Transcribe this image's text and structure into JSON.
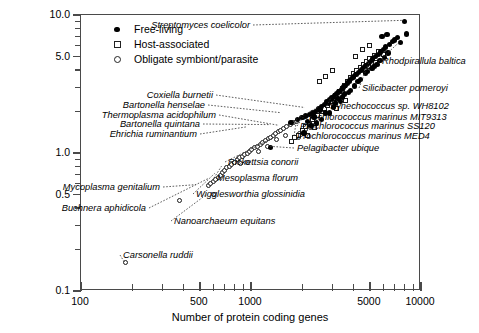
{
  "chart_data": {
    "type": "scatter",
    "title": "",
    "xlabel": "Number of protein coding genes",
    "ylabel": "Genome size (Mb)",
    "xscale": "log",
    "yscale": "log",
    "xlim": [
      100,
      10000
    ],
    "ylim": [
      0.1,
      10.0
    ],
    "grid": false,
    "legend_position": "top-left",
    "xticks": [
      100,
      500,
      1000,
      5000,
      10000
    ],
    "xtick_labels": [
      "100",
      "500",
      "1000",
      "5000",
      "10000"
    ],
    "yticks": [
      0.1,
      0.5,
      1.0,
      5.0,
      10.0
    ],
    "ytick_labels": [
      "0.1",
      "0.5",
      "1.0",
      "5.0",
      "10.0"
    ],
    "legend": [
      {
        "label": "Free-living",
        "marker": "filled-circle"
      },
      {
        "label": "Host-associated",
        "marker": "open-square"
      },
      {
        "label": "Obligate symbiont/parasite",
        "marker": "open-circle"
      }
    ],
    "series": [
      {
        "name": "Obligate symbiont/parasite",
        "marker": "open-circle",
        "points": [
          [
            182,
            0.16
          ],
          [
            380,
            0.45
          ],
          [
            560,
            0.58
          ],
          [
            580,
            0.6
          ],
          [
            600,
            0.62
          ],
          [
            620,
            0.64
          ],
          [
            640,
            0.66
          ],
          [
            660,
            0.69
          ],
          [
            680,
            0.72
          ],
          [
            700,
            0.75
          ],
          [
            720,
            0.78
          ],
          [
            745,
            0.8
          ],
          [
            770,
            0.83
          ],
          [
            800,
            0.86
          ],
          [
            830,
            0.9
          ],
          [
            860,
            0.92
          ],
          [
            890,
            0.95
          ],
          [
            920,
            0.98
          ],
          [
            950,
            1.0
          ],
          [
            980,
            1.03
          ],
          [
            1010,
            1.06
          ],
          [
            1050,
            1.09
          ],
          [
            1090,
            1.12
          ],
          [
            1130,
            1.16
          ],
          [
            1170,
            1.2
          ],
          [
            1210,
            1.24
          ],
          [
            1260,
            1.27
          ],
          [
            1300,
            1.3
          ],
          [
            1350,
            1.34
          ],
          [
            1400,
            1.38
          ],
          [
            1450,
            1.42
          ],
          [
            1500,
            1.46
          ],
          [
            1560,
            1.5
          ],
          [
            1620,
            1.55
          ],
          [
            1700,
            1.6
          ],
          [
            1780,
            1.65
          ],
          [
            1850,
            1.7
          ],
          [
            1930,
            1.38
          ],
          [
            2000,
            1.42
          ],
          [
            2100,
            1.47
          ],
          [
            600,
            0.5
          ],
          [
            960,
            0.86
          ],
          [
            1100,
            1.02
          ],
          [
            1250,
            1.12
          ],
          [
            1420,
            1.25
          ],
          [
            1600,
            1.33
          ],
          [
            2250,
            1.52
          ],
          [
            2400,
            1.6
          ],
          [
            1900,
            1.3
          ],
          [
            870,
            0.84
          ]
        ]
      },
      {
        "name": "Host-associated",
        "marker": "open-square",
        "points": [
          [
            1720,
            1.22
          ],
          [
            1800,
            1.3
          ],
          [
            1900,
            1.35
          ],
          [
            2000,
            1.46
          ],
          [
            2100,
            1.55
          ],
          [
            2200,
            1.62
          ],
          [
            2300,
            1.74
          ],
          [
            2450,
            1.88
          ],
          [
            2600,
            2.0
          ],
          [
            2700,
            2.1
          ],
          [
            2800,
            2.22
          ],
          [
            2950,
            2.35
          ],
          [
            3050,
            2.5
          ],
          [
            3150,
            2.62
          ],
          [
            3300,
            2.78
          ],
          [
            3450,
            2.95
          ],
          [
            3550,
            3.1
          ],
          [
            3700,
            3.3
          ],
          [
            3850,
            3.55
          ],
          [
            4000,
            3.75
          ],
          [
            4200,
            3.95
          ],
          [
            4400,
            4.15
          ],
          [
            4600,
            4.4
          ],
          [
            4800,
            4.6
          ],
          [
            5000,
            4.85
          ],
          [
            5300,
            5.1
          ],
          [
            5600,
            5.4
          ],
          [
            2520,
            3.3
          ],
          [
            2750,
            3.6
          ],
          [
            3000,
            3.95
          ],
          [
            4100,
            5.0
          ],
          [
            4500,
            5.6
          ],
          [
            5000,
            6.0
          ],
          [
            3200,
            2.1
          ],
          [
            3600,
            2.4
          ],
          [
            2350,
            1.52
          ],
          [
            2150,
            1.35
          ],
          [
            4900,
            4.2
          ],
          [
            5400,
            4.55
          ],
          [
            6000,
            5.2
          ]
        ]
      },
      {
        "name": "Free-living",
        "marker": "filled-circle",
        "points": [
          [
            1716,
            1.66
          ],
          [
            1884,
            1.75
          ],
          [
            2000,
            1.8
          ],
          [
            2100,
            1.85
          ],
          [
            2200,
            1.9
          ],
          [
            2300,
            1.95
          ],
          [
            2400,
            2.0
          ],
          [
            2500,
            2.1
          ],
          [
            2600,
            2.18
          ],
          [
            2700,
            2.25
          ],
          [
            2800,
            2.35
          ],
          [
            2900,
            2.42
          ],
          [
            3000,
            2.5
          ],
          [
            3100,
            2.6
          ],
          [
            3200,
            2.7
          ],
          [
            3300,
            2.8
          ],
          [
            3400,
            2.9
          ],
          [
            3500,
            3.0
          ],
          [
            3600,
            3.1
          ],
          [
            3700,
            3.22
          ],
          [
            3800,
            3.32
          ],
          [
            3900,
            3.45
          ],
          [
            4000,
            3.55
          ],
          [
            4150,
            3.7
          ],
          [
            4300,
            3.85
          ],
          [
            4450,
            4.0
          ],
          [
            4600,
            4.15
          ],
          [
            4750,
            4.3
          ],
          [
            4900,
            4.45
          ],
          [
            5050,
            4.6
          ],
          [
            5200,
            4.8
          ],
          [
            5400,
            5.0
          ],
          [
            5600,
            5.2
          ],
          [
            5800,
            5.4
          ],
          [
            6000,
            5.6
          ],
          [
            6200,
            5.85
          ],
          [
            6500,
            6.1
          ],
          [
            6800,
            6.4
          ],
          [
            7000,
            6.6
          ],
          [
            7300,
            6.9
          ],
          [
            5900,
            7.0
          ],
          [
            6300,
            7.2
          ],
          [
            7600,
            6.3
          ],
          [
            8000,
            9.0
          ],
          [
            8200,
            7.3
          ],
          [
            1300,
            1.1
          ],
          [
            2050,
            1.4
          ],
          [
            2250,
            1.58
          ],
          [
            2420,
            1.65
          ],
          [
            2150,
            1.7
          ],
          [
            2600,
            1.75
          ],
          [
            2750,
            1.95
          ],
          [
            3050,
            2.15
          ],
          [
            3350,
            2.35
          ],
          [
            3850,
            2.85
          ],
          [
            4250,
            3.3
          ],
          [
            4700,
            3.8
          ],
          [
            5150,
            4.1
          ],
          [
            5500,
            4.4
          ],
          [
            6100,
            4.9
          ],
          [
            2900,
            1.95
          ],
          [
            3150,
            2.3
          ],
          [
            3450,
            2.55
          ],
          [
            3750,
            2.75
          ],
          [
            4050,
            3.05
          ],
          [
            4400,
            3.4
          ],
          [
            4850,
            3.9
          ],
          [
            5300,
            4.25
          ],
          [
            5750,
            4.7
          ],
          [
            6400,
            5.3
          ],
          [
            2350,
            1.82
          ],
          [
            2550,
            2.05
          ],
          [
            2850,
            2.28
          ],
          [
            3250,
            2.48
          ],
          [
            3550,
            2.68
          ]
        ]
      }
    ],
    "annotations": [
      {
        "text": "Streptomyces coelicolor",
        "x": 8000,
        "y": 9.0
      },
      {
        "text": "Rhodpirallula baltica",
        "x": 7600,
        "y": 6.3
      },
      {
        "text": "Silicibacter pomeroyi",
        "x": 5050,
        "y": 4.6
      },
      {
        "text": "Synechococcus sp. WH8102",
        "x": 3000,
        "y": 2.5
      },
      {
        "text": "Prochlorococcus marinus MIT9313",
        "x": 2500,
        "y": 2.1
      },
      {
        "text": "Prochlorococcus marinus SS120",
        "x": 2100,
        "y": 1.85
      },
      {
        "text": "Prochlorococcus marinus MED4",
        "x": 1884,
        "y": 1.75
      },
      {
        "text": "Pelagibacter ubique",
        "x": 1300,
        "y": 1.1
      },
      {
        "text": "Coxiella burnetii",
        "x": 2100,
        "y": 2.1
      },
      {
        "text": "Bartonella henselae",
        "x": 1500,
        "y": 1.93
      },
      {
        "text": "Thermoplasma acidophilum",
        "x": 1480,
        "y": 1.56
      },
      {
        "text": "Bartonella quintana",
        "x": 1300,
        "y": 1.58
      },
      {
        "text": "Ehrichia ruminantium",
        "x": 950,
        "y": 1.52
      },
      {
        "text": "Rickettsia conorii",
        "x": 1370,
        "y": 1.27
      },
      {
        "text": "Mesoplasma florum",
        "x": 680,
        "y": 0.79
      },
      {
        "text": "Wigglesworthia glossinidia",
        "x": 620,
        "y": 0.7
      },
      {
        "text": "Mycoplasma genitalium",
        "x": 480,
        "y": 0.58
      },
      {
        "text": "Buchnera aphidicola",
        "x": 564,
        "y": 0.64
      },
      {
        "text": "Nanoarchaeum equitans",
        "x": 552,
        "y": 0.49
      },
      {
        "text": "Carsonella ruddii",
        "x": 182,
        "y": 0.16
      }
    ]
  }
}
